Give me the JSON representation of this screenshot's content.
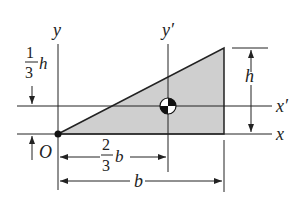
{
  "figure": {
    "type": "triangle-centroid-diagram",
    "colors": {
      "fill": "#cfcfcf",
      "stroke": "#222222",
      "background": "#ffffff"
    },
    "axes": {
      "x": "x",
      "y": "y",
      "x_prime": "x′",
      "y_prime": "y′",
      "origin": "O"
    },
    "dimensions": {
      "height": "h",
      "base": "b",
      "centroid_x_num": "2",
      "centroid_x_den": "3",
      "centroid_x_var": "b",
      "centroid_y_num": "1",
      "centroid_y_den": "3",
      "centroid_y_var": "h"
    }
  }
}
